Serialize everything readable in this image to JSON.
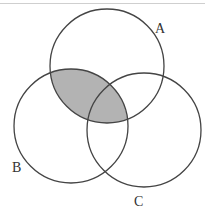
{
  "diagram": {
    "type": "venn",
    "sets": [
      {
        "label": "A",
        "cx": 107,
        "cy": 66,
        "r": 57
      },
      {
        "label": "B",
        "cx": 71,
        "cy": 126,
        "r": 57
      },
      {
        "label": "C",
        "cx": 144,
        "cy": 130,
        "r": 57
      }
    ],
    "shaded_region": "A ∩ B",
    "shade_color": "#b3b3b3",
    "stroke_color": "#444444"
  },
  "labels": {
    "a": "A",
    "b": "B",
    "c": "C"
  }
}
